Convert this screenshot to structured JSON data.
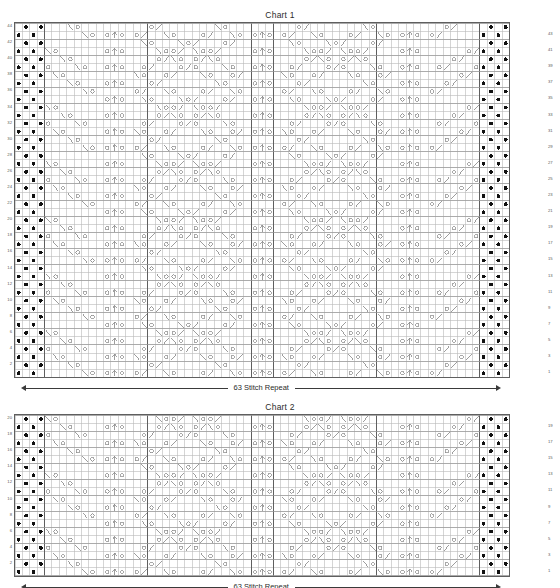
{
  "charts": [
    {
      "id": "chart-1",
      "title": "Chart 1",
      "rows": 44,
      "cols": 67,
      "repeat_label": "63 Stitch Repeat",
      "row_numbers_left": [
        44,
        42,
        40,
        38,
        36,
        34,
        32,
        30,
        28,
        26,
        24,
        22,
        20,
        18,
        16,
        14,
        12,
        10,
        8,
        6,
        4,
        2
      ],
      "row_numbers_right": [
        43,
        41,
        39,
        37,
        35,
        33,
        31,
        29,
        27,
        25,
        23,
        21,
        19,
        17,
        15,
        13,
        11,
        9,
        7,
        5,
        3,
        1
      ],
      "legend_symbols": [
        "purl-dot",
        "yarn-over",
        "k2tog-right-slant",
        "ssk-left-slant",
        "centered-double-decrease"
      ],
      "border_columns_left": 4,
      "border_columns_right": 4,
      "section_divider_columns": [
        4,
        18,
        32,
        35,
        49,
        63
      ],
      "center_column": 34
    },
    {
      "id": "chart-2",
      "title": "Chart 2",
      "rows": 20,
      "cols": 67,
      "repeat_label": "63 Stitch Repeat",
      "row_numbers_left": [
        20,
        18,
        16,
        14,
        12,
        10,
        8,
        6,
        4,
        2
      ],
      "row_numbers_right": [
        19,
        17,
        15,
        13,
        11,
        9,
        7,
        5,
        3,
        1
      ],
      "legend_symbols": [
        "purl-dot",
        "yarn-over",
        "k2tog-right-slant",
        "ssk-left-slant",
        "centered-double-decrease"
      ],
      "border_columns_left": 4,
      "border_columns_right": 4,
      "section_divider_columns": [
        4,
        18,
        32,
        35,
        49,
        63
      ],
      "center_column": 34
    }
  ],
  "colors": {
    "grid_line": "#b9b9b9",
    "grid_line_major": "#5f5f5f",
    "border": "#5f5f5f",
    "symbol": "#8c8c8c",
    "dot": "#111111",
    "text": "#2b2b2b",
    "number": "#5a5a5a",
    "arrow": "#3a3a3a",
    "background": "#ffffff"
  },
  "geometry": {
    "cell_w": 7.38,
    "chart1_x": 14,
    "chart1_y": 22,
    "chart1_row_h": 8.05,
    "chart2_x": 14,
    "chart2_y": 414,
    "chart2_row_h": 8.05
  }
}
